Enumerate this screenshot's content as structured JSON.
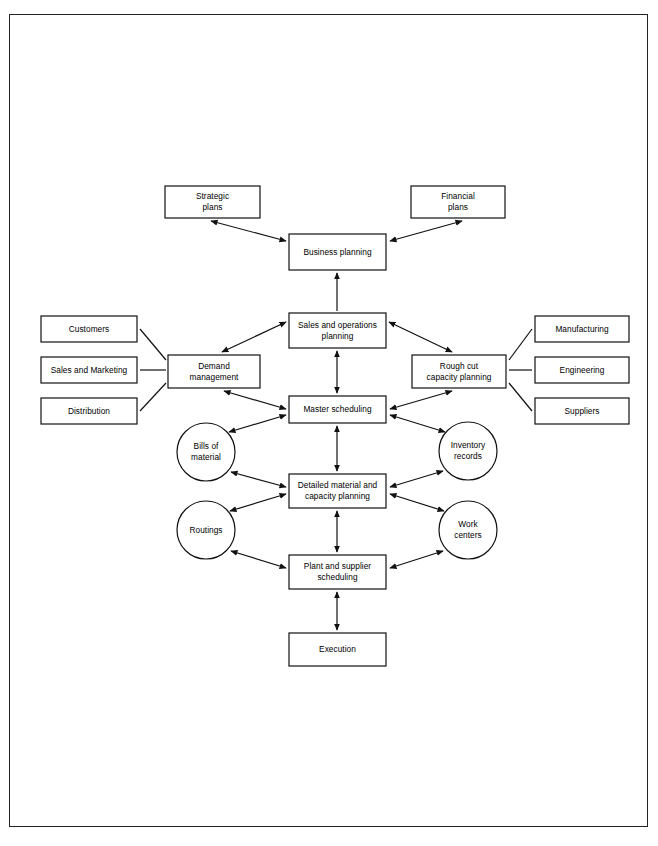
{
  "diagram": {
    "type": "flowchart",
    "frame": {
      "stroke": "#222222"
    },
    "style": {
      "node_stroke": "#111111",
      "node_fill": "#ffffff",
      "text_color": "#000000"
    },
    "nodes": [
      {
        "id": "strategic-plans",
        "shape": "rect",
        "label": "Strategic\nplans",
        "x": 165,
        "y": 186,
        "w": 95,
        "h": 32
      },
      {
        "id": "financial-plans",
        "shape": "rect",
        "label": "Financial\nplans",
        "x": 411,
        "y": 186,
        "w": 94,
        "h": 32
      },
      {
        "id": "business-planning",
        "shape": "rect",
        "label": "Business planning",
        "x": 289,
        "y": 234,
        "w": 97,
        "h": 36
      },
      {
        "id": "sales-operations",
        "shape": "rect",
        "label": "Sales and operations\nplanning",
        "x": 289,
        "y": 313,
        "w": 97,
        "h": 35
      },
      {
        "id": "customers",
        "shape": "rect",
        "label": "Customers",
        "x": 41,
        "y": 316,
        "w": 96,
        "h": 26
      },
      {
        "id": "manufacturing",
        "shape": "rect",
        "label": "Manufacturing",
        "x": 535,
        "y": 316,
        "w": 94,
        "h": 26
      },
      {
        "id": "demand-management",
        "shape": "rect",
        "label": "Demand\nmanagement",
        "x": 168,
        "y": 355,
        "w": 92,
        "h": 33
      },
      {
        "id": "rough-cut-capacity",
        "shape": "rect",
        "label": "Rough cut\ncapacity planning",
        "x": 412,
        "y": 355,
        "w": 94,
        "h": 33
      },
      {
        "id": "sales-and-marketing",
        "shape": "rect",
        "label": "Sales and Marketing",
        "x": 41,
        "y": 357,
        "w": 96,
        "h": 26
      },
      {
        "id": "engineering",
        "shape": "rect",
        "label": "Engineering",
        "x": 535,
        "y": 357,
        "w": 94,
        "h": 26
      },
      {
        "id": "distribution",
        "shape": "rect",
        "label": "Distribution",
        "x": 41,
        "y": 398,
        "w": 96,
        "h": 26
      },
      {
        "id": "suppliers",
        "shape": "rect",
        "label": "Suppliers",
        "x": 535,
        "y": 398,
        "w": 94,
        "h": 26
      },
      {
        "id": "master-scheduling",
        "shape": "rect",
        "label": "Master scheduling",
        "x": 289,
        "y": 396,
        "w": 97,
        "h": 27
      },
      {
        "id": "bills-of-material",
        "shape": "circle",
        "label": "Bills of\nmaterial",
        "x": 177,
        "y": 423,
        "w": 58,
        "h": 58
      },
      {
        "id": "inventory-records",
        "shape": "circle",
        "label": "Inventory\nrecords",
        "x": 439,
        "y": 422,
        "w": 58,
        "h": 58
      },
      {
        "id": "detailed-material",
        "shape": "rect",
        "label": "Detailed material and\ncapacity planning",
        "x": 289,
        "y": 474,
        "w": 97,
        "h": 34
      },
      {
        "id": "routings",
        "shape": "circle",
        "label": "Routings",
        "x": 177,
        "y": 501,
        "w": 58,
        "h": 58
      },
      {
        "id": "work-centers",
        "shape": "circle",
        "label": "Work\ncenters",
        "x": 439,
        "y": 501,
        "w": 58,
        "h": 58
      },
      {
        "id": "plant-supplier",
        "shape": "rect",
        "label": "Plant and supplier\nscheduling",
        "x": 289,
        "y": 555,
        "w": 97,
        "h": 34
      },
      {
        "id": "execution",
        "shape": "rect",
        "label": "Execution",
        "x": 289,
        "y": 633,
        "w": 97,
        "h": 33
      }
    ],
    "edges": [
      {
        "id": "business-to-strategic",
        "from": "business-planning",
        "to": "strategic-plans",
        "arrows": "both",
        "x1": 286,
        "y1": 241,
        "x2": 211,
        "y2": 221
      },
      {
        "id": "business-to-financial",
        "from": "business-planning",
        "to": "financial-plans",
        "arrows": "both",
        "x1": 390,
        "y1": 241,
        "x2": 462,
        "y2": 221
      },
      {
        "id": "sop-to-business",
        "from": "sales-operations",
        "to": "business-planning",
        "arrows": "up",
        "x1": 337,
        "y1": 311,
        "x2": 337,
        "y2": 273
      },
      {
        "id": "sop-to-demand",
        "from": "sales-operations",
        "to": "demand-management",
        "arrows": "both",
        "x1": 286,
        "y1": 322,
        "x2": 222,
        "y2": 352
      },
      {
        "id": "sop-to-roughcut",
        "from": "sales-operations",
        "to": "rough-cut-capacity",
        "arrows": "both",
        "x1": 389,
        "y1": 322,
        "x2": 452,
        "y2": 352
      },
      {
        "id": "sop-to-master",
        "from": "sales-operations",
        "to": "master-scheduling",
        "arrows": "both",
        "x1": 337,
        "y1": 351,
        "x2": 337,
        "y2": 393
      },
      {
        "id": "customers-to-demand",
        "from": "customers",
        "to": "demand-management",
        "arrows": "none",
        "x1": 140,
        "y1": 329,
        "x2": 166,
        "y2": 360
      },
      {
        "id": "marketing-to-demand",
        "from": "sales-and-marketing",
        "to": "demand-management",
        "arrows": "none",
        "x1": 140,
        "y1": 370,
        "x2": 166,
        "y2": 370
      },
      {
        "id": "distribution-to-demand",
        "from": "distribution",
        "to": "demand-management",
        "arrows": "none",
        "x1": 140,
        "y1": 411,
        "x2": 166,
        "y2": 383
      },
      {
        "id": "roughcut-to-manufacturing",
        "from": "rough-cut-capacity",
        "to": "manufacturing",
        "arrows": "none",
        "x1": 509,
        "y1": 360,
        "x2": 532,
        "y2": 329
      },
      {
        "id": "roughcut-to-engineering",
        "from": "rough-cut-capacity",
        "to": "engineering",
        "arrows": "none",
        "x1": 509,
        "y1": 370,
        "x2": 532,
        "y2": 370
      },
      {
        "id": "roughcut-to-suppliers",
        "from": "rough-cut-capacity",
        "to": "suppliers",
        "arrows": "none",
        "x1": 509,
        "y1": 383,
        "x2": 532,
        "y2": 411
      },
      {
        "id": "demand-to-master",
        "from": "demand-management",
        "to": "master-scheduling",
        "arrows": "both",
        "x1": 224,
        "y1": 391,
        "x2": 286,
        "y2": 409
      },
      {
        "id": "roughcut-to-master",
        "from": "rough-cut-capacity",
        "to": "master-scheduling",
        "arrows": "both",
        "x1": 452,
        "y1": 391,
        "x2": 390,
        "y2": 409
      },
      {
        "id": "master-to-bills",
        "from": "master-scheduling",
        "to": "bills-of-material",
        "arrows": "both",
        "x1": 286,
        "y1": 415,
        "x2": 229,
        "y2": 432
      },
      {
        "id": "master-to-inventory",
        "from": "master-scheduling",
        "to": "inventory-records",
        "arrows": "both",
        "x1": 390,
        "y1": 415,
        "x2": 445,
        "y2": 432
      },
      {
        "id": "master-to-detailed",
        "from": "master-scheduling",
        "to": "detailed-material",
        "arrows": "both",
        "x1": 337,
        "y1": 426,
        "x2": 337,
        "y2": 471
      },
      {
        "id": "bills-to-detailed",
        "from": "bills-of-material",
        "to": "detailed-material",
        "arrows": "both",
        "x1": 231,
        "y1": 472,
        "x2": 286,
        "y2": 487
      },
      {
        "id": "inventory-to-detailed",
        "from": "inventory-records",
        "to": "detailed-material",
        "arrows": "both",
        "x1": 443,
        "y1": 471,
        "x2": 390,
        "y2": 487
      },
      {
        "id": "detailed-to-routings",
        "from": "detailed-material",
        "to": "routings",
        "arrows": "both",
        "x1": 286,
        "y1": 494,
        "x2": 230,
        "y2": 511
      },
      {
        "id": "detailed-to-workcenters",
        "from": "detailed-material",
        "to": "work-centers",
        "arrows": "both",
        "x1": 390,
        "y1": 494,
        "x2": 444,
        "y2": 511
      },
      {
        "id": "detailed-to-plant",
        "from": "detailed-material",
        "to": "plant-supplier",
        "arrows": "both",
        "x1": 337,
        "y1": 511,
        "x2": 337,
        "y2": 552
      },
      {
        "id": "routings-to-plant",
        "from": "routings",
        "to": "plant-supplier",
        "arrows": "both",
        "x1": 231,
        "y1": 551,
        "x2": 286,
        "y2": 568
      },
      {
        "id": "workcenters-to-plant",
        "from": "work-centers",
        "to": "plant-supplier",
        "arrows": "both",
        "x1": 443,
        "y1": 551,
        "x2": 390,
        "y2": 568
      },
      {
        "id": "plant-to-execution",
        "from": "plant-supplier",
        "to": "execution",
        "arrows": "both",
        "x1": 337,
        "y1": 592,
        "x2": 337,
        "y2": 630
      }
    ]
  }
}
